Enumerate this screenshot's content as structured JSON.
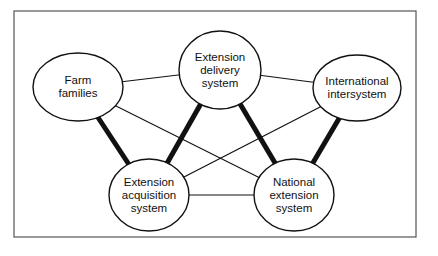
{
  "diagram": {
    "type": "network",
    "nodes": [
      {
        "id": "farm",
        "label_lines": [
          "Farm",
          "families"
        ],
        "cx": 78,
        "cy": 87,
        "rx": 45,
        "ry": 34
      },
      {
        "id": "delivery",
        "label_lines": [
          "Extension",
          "delivery",
          "system"
        ],
        "cx": 220,
        "cy": 70,
        "rx": 41,
        "ry": 39
      },
      {
        "id": "international",
        "label_lines": [
          "International",
          "intersystem"
        ],
        "cx": 357,
        "cy": 88,
        "rx": 44,
        "ry": 33
      },
      {
        "id": "acquisition",
        "label_lines": [
          "Extension",
          "acquisition",
          "system"
        ],
        "cx": 149,
        "cy": 195,
        "rx": 40,
        "ry": 36
      },
      {
        "id": "national",
        "label_lines": [
          "National",
          "extension",
          "system"
        ],
        "cx": 294,
        "cy": 195,
        "rx": 40,
        "ry": 36
      }
    ],
    "edges": [
      {
        "from": "farm",
        "to": "delivery",
        "weight": "thin"
      },
      {
        "from": "farm",
        "to": "acquisition",
        "weight": "thick"
      },
      {
        "from": "farm",
        "to": "national",
        "weight": "thin"
      },
      {
        "from": "delivery",
        "to": "international",
        "weight": "thin"
      },
      {
        "from": "delivery",
        "to": "acquisition",
        "weight": "thick"
      },
      {
        "from": "delivery",
        "to": "national",
        "weight": "thick"
      },
      {
        "from": "international",
        "to": "acquisition",
        "weight": "thin"
      },
      {
        "from": "international",
        "to": "national",
        "weight": "thick"
      },
      {
        "from": "acquisition",
        "to": "national",
        "weight": "thin"
      }
    ],
    "colors": {
      "stroke": "#111111",
      "frame": "#555555",
      "background": "#ffffff"
    }
  }
}
